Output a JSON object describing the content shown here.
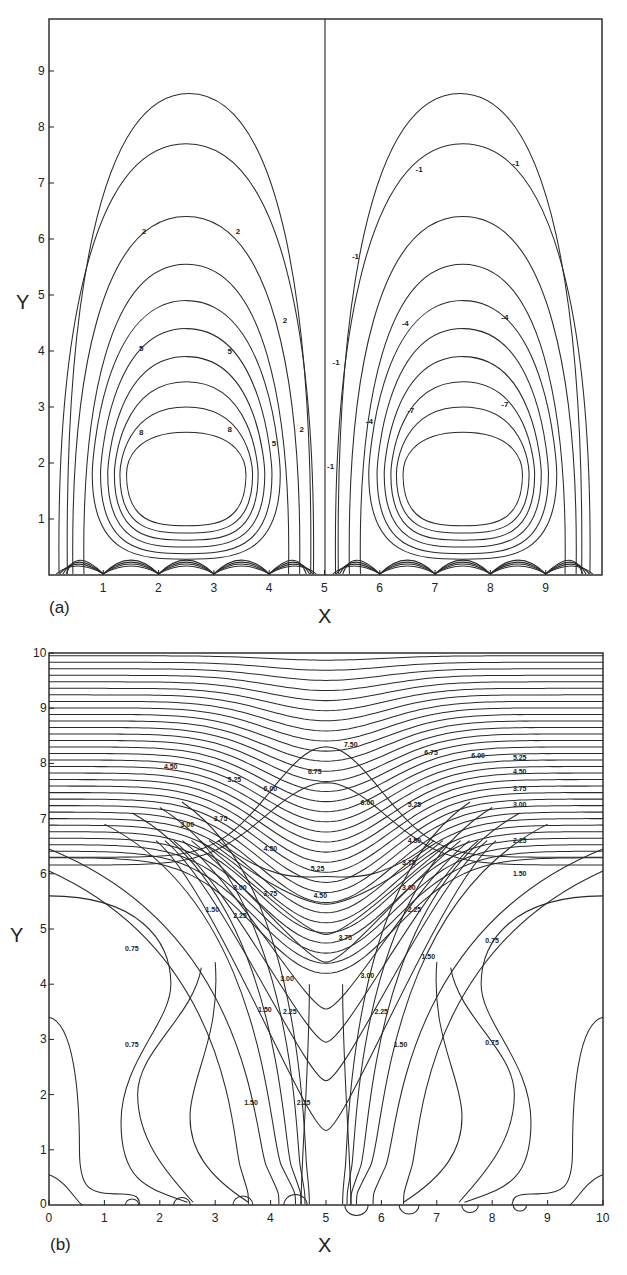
{
  "figure": {
    "panels": [
      {
        "label": "(a)",
        "xlabel": "X",
        "ylabel": "Y"
      },
      {
        "label": "(b)",
        "xlabel": "X",
        "ylabel": "Y"
      }
    ]
  },
  "chart_data": [
    {
      "type": "contour",
      "panel": "(a)",
      "title": "",
      "xlabel": "X",
      "ylabel": "Y",
      "xlim": [
        0,
        10
      ],
      "ylim": [
        0,
        9.9
      ],
      "x_ticks": [
        1,
        2,
        3,
        4,
        5,
        6,
        7,
        8,
        9
      ],
      "y_ticks": [
        1,
        2,
        3,
        4,
        5,
        6,
        7,
        8,
        9
      ],
      "grid": false,
      "divider_x": 5,
      "description": "Two counter-rotating cells (streamlines). Left cell positive values, right cell negative values; centers near x=2.5 and x=7.5, y≈1.8. Wavy boundary layer near y=0.",
      "left_cell": {
        "center": [
          2.5,
          1.8
        ],
        "contour_labels": [
          "2",
          "2",
          "2",
          "2",
          "5",
          "5",
          "5",
          "8",
          "8"
        ],
        "levels_tops_y": [
          7.7,
          6.4,
          5.55,
          4.9,
          4.4,
          3.9,
          3.45,
          3.0,
          2.55
        ]
      },
      "right_cell": {
        "center": [
          7.5,
          1.8
        ],
        "contour_labels": [
          "-1",
          "-1",
          "-1",
          "-1",
          "-1",
          "-4",
          "-4",
          "-4",
          "-7",
          "-7"
        ],
        "levels_tops_y": [
          7.7,
          6.4,
          5.55,
          4.9,
          4.4,
          3.9,
          3.45,
          3.0,
          2.55
        ]
      }
    },
    {
      "type": "contour",
      "panel": "(b)",
      "title": "",
      "xlabel": "X",
      "ylabel": "Y",
      "xlim": [
        0,
        10
      ],
      "ylim": [
        0,
        10
      ],
      "x_ticks": [
        0,
        1,
        2,
        3,
        4,
        5,
        6,
        7,
        8,
        9,
        10
      ],
      "y_ticks": [
        0,
        1,
        2,
        3,
        4,
        5,
        6,
        7,
        8,
        9,
        10
      ],
      "grid": false,
      "description": "Scalar field contours symmetric about x=5, dense horizontal near top, V-shaped trough at x=5 dipping toward y≈1.3.",
      "contour_levels": [
        0.75,
        1.5,
        2.25,
        3.0,
        3.75,
        4.5,
        5.25,
        6.0,
        6.75,
        7.5
      ],
      "contour_labels": [
        "7.50",
        "6.75",
        "6.00",
        "5.25",
        "4.50",
        "3.75",
        "3.00",
        "2.25",
        "1.50",
        "0.75"
      ],
      "center_trough_min_y": [
        8.3,
        7.65,
        7.0,
        6.5,
        6.05,
        5.55,
        4.9,
        4.2,
        3.3,
        2.35,
        1.35
      ]
    }
  ]
}
